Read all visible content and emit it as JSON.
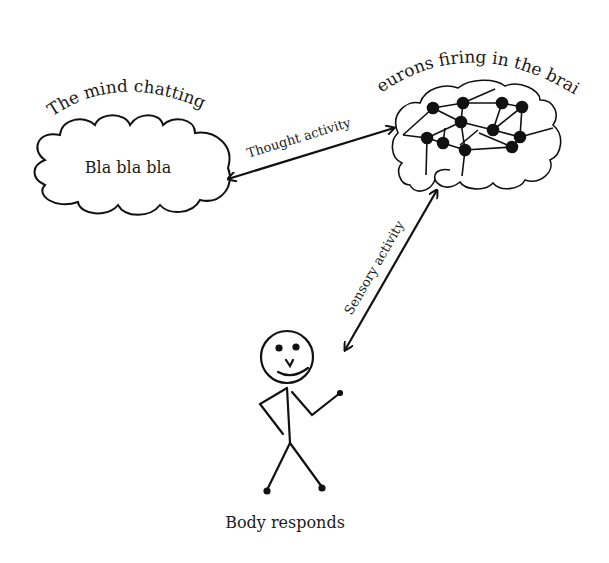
{
  "diagram": {
    "nodes": {
      "mind": {
        "title": "The mind chatting",
        "content": "Bla bla bla",
        "shape": "cloud-icon"
      },
      "brain": {
        "title": "Neurons firing in the brain",
        "shape": "brain-network-icon"
      },
      "body": {
        "title": "Body responds",
        "shape": "stick-figure-icon"
      }
    },
    "edges": [
      {
        "from": "mind",
        "to": "brain",
        "label": "Thought activity",
        "bidirectional": true
      },
      {
        "from": "brain",
        "to": "body",
        "label": "Sensory activity",
        "bidirectional": true
      }
    ],
    "colors": {
      "stroke": "#111111",
      "background": "#ffffff",
      "text": "#1a1a1a"
    }
  }
}
